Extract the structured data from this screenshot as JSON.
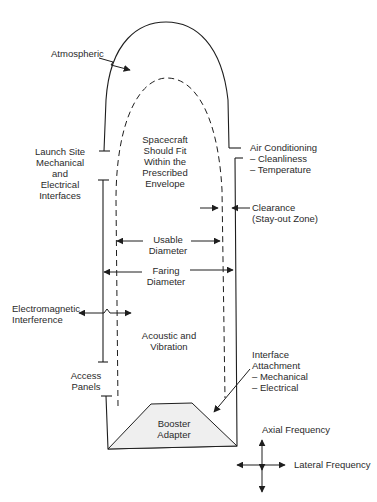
{
  "diagram": {
    "labels": {
      "atmospheric": [
        "Atmospheric"
      ],
      "launch_site": [
        "Launch Site",
        "Mechanical",
        "and",
        "Electrical",
        "Interfaces"
      ],
      "envelope": [
        "Spacecraft",
        "Should Fit",
        "Within the",
        "Prescribed",
        "Envelope"
      ],
      "air_conditioning": [
        "Air Conditioning",
        "– Cleanliness",
        "– Temperature"
      ],
      "clearance": [
        "Clearance",
        "(Stay-out Zone)"
      ],
      "usable_diameter": [
        "Usable",
        "Diameter"
      ],
      "faring_diameter": [
        "Faring",
        "Diameter"
      ],
      "electromagnetic": [
        "Electromagnetic",
        "Interference"
      ],
      "acoustic": [
        "Acoustic and",
        "Vibration"
      ],
      "access_panels": [
        "Access",
        "Panels"
      ],
      "interface_attachment": [
        "Interface",
        "Attachment",
        "– Mechanical",
        "– Electrical"
      ],
      "booster_adapter": [
        "Booster",
        "Adapter"
      ],
      "axial_frequency": [
        "Axial Frequency"
      ],
      "lateral_frequency": [
        "Lateral Frequency"
      ]
    },
    "colors": {
      "line": "#1e1e1e",
      "adapter_fill": "#efefef",
      "background": "#ffffff"
    }
  }
}
